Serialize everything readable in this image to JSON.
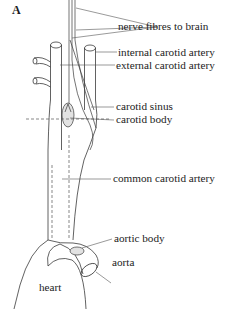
{
  "figure": {
    "panel_label": "A",
    "labels": {
      "nerve_fibres": "nerve fibres to brain",
      "internal_carotid": "internal carotid artery",
      "external_carotid": "external carotid artery",
      "carotid_sinus": "carotid sinus",
      "carotid_body": "carotid body",
      "common_carotid": "common carotid artery",
      "aortic_body": "aortic body",
      "aorta": "aorta",
      "heart": "heart"
    },
    "colors": {
      "line": "#3a3a3a",
      "text": "#1c1c1c",
      "glomus_fill": "#e2e2e2"
    }
  }
}
